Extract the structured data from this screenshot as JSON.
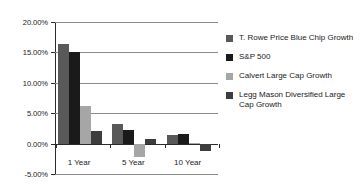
{
  "chart_data": {
    "type": "bar",
    "title": "",
    "xlabel": "",
    "ylabel": "",
    "categories": [
      "1 Year",
      "5 Year",
      "10 Year"
    ],
    "series": [
      {
        "name": "T. Rowe Price Blue Chip Growth",
        "color": "#595959",
        "values": [
          16.3,
          3.2,
          1.4
        ]
      },
      {
        "name": "S&P 500",
        "color": "#1a1a1a",
        "values": [
          15.0,
          2.2,
          1.5
        ]
      },
      {
        "name": "Calvert Large Cap Growth",
        "color": "#a6a6a6",
        "values": [
          6.2,
          -2.2,
          0.05
        ]
      },
      {
        "name": "Legg Mason Diversified Large Cap Growth",
        "color": "#3d3d3d",
        "values": [
          2.1,
          0.7,
          -1.3
        ]
      }
    ],
    "ylim": [
      -5,
      20
    ],
    "ytick_values": [
      20,
      15,
      10,
      5,
      0,
      -5
    ],
    "ytick_labels": [
      "20.00%",
      "15.00%",
      "10.00%",
      "5.00%",
      "0.00%",
      "-5.00%"
    ],
    "grid": true,
    "legend_position": "right",
    "value_format": "percent"
  },
  "legend": {
    "items": [
      {
        "label": "T. Rowe Price Blue Chip Growth",
        "color": "#595959"
      },
      {
        "label": "S&P 500",
        "color": "#1a1a1a"
      },
      {
        "label": "Calvert Large Cap Growth",
        "color": "#a6a6a6"
      },
      {
        "label": "Legg Mason Diversified Large Cap Growth",
        "color": "#3d3d3d"
      }
    ]
  }
}
